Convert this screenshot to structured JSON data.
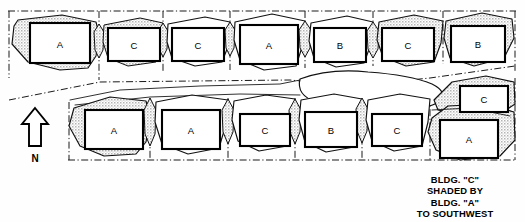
{
  "diagram": {
    "background_color": "#fefefe",
    "line_color": "#111111",
    "shadow_fill_color": "#c8c8c8",
    "building_fill_color": "#ffffff"
  },
  "north_arrow": {
    "label": "N",
    "direction": "up",
    "icon": "north-arrow-icon"
  },
  "caption": {
    "line1": "BLDG. \"C\"",
    "line2": "SHADED BY",
    "line3": "BLDG. \"A\"",
    "line4": "TO SOUTHWEST"
  },
  "rows": [
    {
      "name": "upper-row",
      "buildings": [
        {
          "label": "A",
          "x": 30,
          "y": 23,
          "w": 60,
          "h": 40,
          "shaded": true
        },
        {
          "label": "C",
          "x": 108,
          "y": 28,
          "w": 52,
          "h": 33,
          "shaded": true
        },
        {
          "label": "C",
          "x": 172,
          "y": 28,
          "w": 52,
          "h": 33,
          "shaded": false
        },
        {
          "label": "A",
          "x": 240,
          "y": 25,
          "w": 58,
          "h": 39,
          "shaded": false
        },
        {
          "label": "B",
          "x": 314,
          "y": 28,
          "w": 52,
          "h": 34,
          "shaded": false
        },
        {
          "label": "C",
          "x": 382,
          "y": 28,
          "w": 52,
          "h": 33,
          "shaded": true
        },
        {
          "label": "B",
          "x": 451,
          "y": 26,
          "w": 54,
          "h": 36,
          "shaded": true
        }
      ]
    },
    {
      "name": "lower-row",
      "buildings": [
        {
          "label": "A",
          "x": 85,
          "y": 110,
          "w": 58,
          "h": 39,
          "shaded": true
        },
        {
          "label": "A",
          "x": 162,
          "y": 110,
          "w": 58,
          "h": 39,
          "shaded": false
        },
        {
          "label": "C",
          "x": 240,
          "y": 114,
          "w": 50,
          "h": 32,
          "shaded": false
        },
        {
          "label": "B",
          "x": 305,
          "y": 112,
          "w": 52,
          "h": 35,
          "shaded": false
        },
        {
          "label": "C",
          "x": 372,
          "y": 114,
          "w": 50,
          "h": 32,
          "shaded": false
        },
        {
          "label": "C",
          "x": 460,
          "y": 86,
          "w": 48,
          "h": 26,
          "shaded": true
        },
        {
          "label": "A",
          "x": 440,
          "y": 120,
          "w": 58,
          "h": 38,
          "shaded": true
        }
      ]
    }
  ],
  "lot_lines": {
    "style": "dash-dot",
    "top_boundary_y": 10,
    "bottom_boundary_y": 160,
    "left_boundary_x": 8,
    "right_boundary_x": 516,
    "divider": "diagonal-street-centerline"
  }
}
